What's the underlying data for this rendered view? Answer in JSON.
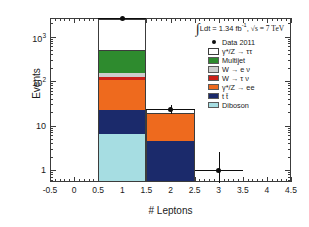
{
  "chart_data": {
    "type": "bar",
    "title": "",
    "xlabel": "# Leptons",
    "ylabel": "Events",
    "yscale": "log",
    "xlim": [
      -0.5,
      4.5
    ],
    "ylim": [
      0.5,
      5000
    ],
    "grid": false,
    "legend_position": "top-right",
    "annotation": "∫ Ldt = 1.34 fb⁻¹, √s = 7 TeV",
    "bin_edges": [
      0.5,
      1.5,
      2.5,
      3.5
    ],
    "bin_centers": [
      1,
      2,
      3
    ],
    "x_ticks": [
      "-0.5",
      "0",
      "0.5",
      "1",
      "1.5",
      "2",
      "2.5",
      "3",
      "3.5",
      "4",
      "4.5"
    ],
    "y_ticks": [
      "1",
      "10",
      "10²",
      "10³"
    ],
    "stack_order_bottom_to_top": [
      "Diboson",
      "tt̄",
      "γ*/Z → ee",
      "W → τν",
      "W → eν",
      "Multijet",
      "γ*/Z → ττ"
    ],
    "series": [
      {
        "name": "Diboson",
        "color": "#a6dde2",
        "values": [
          6.6,
          0,
          0
        ]
      },
      {
        "name": "tt",
        "color": "#1b2a6b",
        "values": [
          15.4,
          4.4,
          0
        ]
      },
      {
        "name": "gammaZ_ee",
        "color": "#ee6a1e",
        "values": [
          83,
          13.6,
          0
        ]
      },
      {
        "name": "W_taunu",
        "color": "#cc2018",
        "values": [
          18,
          0,
          0
        ]
      },
      {
        "name": "W_enu",
        "color": "#cdcdcd",
        "values": [
          32,
          0,
          0
        ]
      },
      {
        "name": "Multijet",
        "color": "#2e8b2e",
        "values": [
          320,
          0,
          0
        ]
      },
      {
        "name": "gammaZ_tautau",
        "color": "#ffffff",
        "values": [
          2030,
          5.0,
          0
        ]
      }
    ],
    "stack_totals": [
      2505,
      23,
      0
    ],
    "data_points": [
      {
        "x": 1,
        "y": 2600,
        "err_up": 60,
        "err_down": 60
      },
      {
        "x": 2,
        "y": 23,
        "err_up": 6,
        "err_down": 5
      },
      {
        "x": 3,
        "y": 1,
        "err_up": 1.5,
        "err_down": 0.72
      }
    ]
  },
  "axes": {
    "y_title": "Events",
    "x_title": "# Leptons",
    "y_ticks": [
      {
        "label": "10",
        "exp": "3",
        "value": 1000
      },
      {
        "label": "10",
        "exp": "2",
        "value": 100
      },
      {
        "label": "10",
        "exp": "",
        "value": 10
      },
      {
        "label": "1",
        "exp": "",
        "value": 1
      }
    ],
    "x_ticks": [
      {
        "label": "-0.5",
        "value": -0.5
      },
      {
        "label": "0",
        "value": 0
      },
      {
        "label": "0.5",
        "value": 0.5
      },
      {
        "label": "1",
        "value": 1
      },
      {
        "label": "1.5",
        "value": 1.5
      },
      {
        "label": "2",
        "value": 2
      },
      {
        "label": "2.5",
        "value": 2.5
      },
      {
        "label": "3",
        "value": 3
      },
      {
        "label": "3.5",
        "value": 3.5
      },
      {
        "label": "4",
        "value": 4
      },
      {
        "label": "4.5",
        "value": 4.5
      }
    ]
  },
  "annotation": {
    "integral_symbol": "∫",
    "text_before_sup": "Ldt = 1.34 fb",
    "superscript": "-1",
    "text_after": ", ",
    "sqrt_s": "√s = 7 TeV"
  },
  "legend": {
    "entries": [
      {
        "label": "Data 2011",
        "marker": "point",
        "color": "#0d0d0d"
      },
      {
        "label": "γ*/Z →  ττ",
        "marker": "box-open",
        "color": "#ffffff"
      },
      {
        "label": "Multijet",
        "marker": "box",
        "color": "#2e8b2e"
      },
      {
        "label": "W → e ν",
        "marker": "box",
        "color": "#cdcdcd"
      },
      {
        "label": "W → τ ν",
        "marker": "box",
        "color": "#cc2018"
      },
      {
        "label": "γ*/Z → ee",
        "marker": "box",
        "color": "#ee6a1e"
      },
      {
        "label": "t t̄",
        "marker": "box",
        "color": "#1b2a6b"
      },
      {
        "label": "Diboson",
        "marker": "box",
        "color": "#a6dde2"
      }
    ]
  },
  "colors": {
    "axis": "#3c3c3c",
    "data_marker": "#0d0d0d",
    "background": "#ffffff"
  }
}
